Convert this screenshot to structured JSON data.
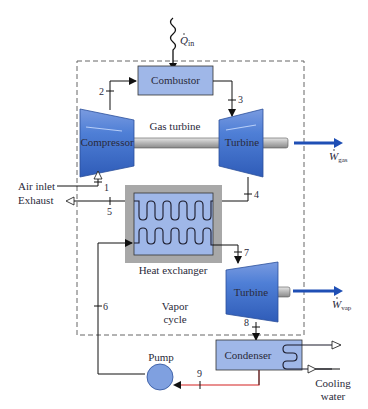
{
  "diagram": {
    "heat_input_label": "Q",
    "heat_input_sub": "in",
    "components": {
      "combustor": "Combustor",
      "compressor": "Compressor",
      "gas_turbine": "Turbine",
      "gas_turbine_caption": "Gas turbine",
      "heat_exchanger": "Heat exchanger",
      "vapor_turbine": "Turbine",
      "vapor_cycle_line1": "Vapor",
      "vapor_cycle_line2": "cycle",
      "condenser": "Condenser",
      "pump": "Pump"
    },
    "work_outputs": {
      "gas": {
        "symbol": "W",
        "sub": "gas"
      },
      "vap": {
        "symbol": "W",
        "sub": "vap"
      }
    },
    "streams": {
      "air_inlet": "Air inlet",
      "exhaust": "Exhaust",
      "cooling_line1": "Cooling",
      "cooling_line2": "water"
    },
    "state_points": [
      "1",
      "2",
      "3",
      "4",
      "5",
      "6",
      "7",
      "8",
      "9"
    ],
    "colors": {
      "component_fill": "#9fb7e8",
      "turbine_fill": "#4a78cc",
      "work_arrow": "#1f4fb5",
      "hx_shell": "#a8a8a8",
      "red_line": "#d42020",
      "line": "#222222"
    }
  }
}
